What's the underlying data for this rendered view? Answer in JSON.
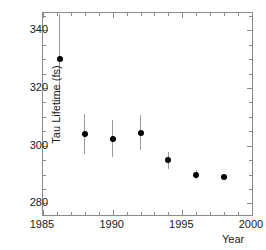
{
  "chart_data": {
    "type": "scatter",
    "title": "",
    "xlabel": "Year",
    "ylabel": "Tau Lifetime (fs)",
    "xlim": [
      1985,
      2000
    ],
    "ylim": [
      276,
      346
    ],
    "grid": false,
    "legend": null,
    "xticks": [
      1985,
      1990,
      1995,
      2000
    ],
    "xtick_labels": [
      "1985",
      "1990",
      "1995",
      "2000"
    ],
    "yticks": [
      280,
      300,
      320,
      340
    ],
    "ytick_labels": [
      "280",
      "300",
      "320",
      "340"
    ],
    "x": [
      1986.2,
      1988.0,
      1990.0,
      1992.0,
      1994.0,
      1996.0,
      1998.0
    ],
    "values": [
      330.0,
      304.0,
      302.5,
      304.5,
      295.0,
      290.0,
      289.0
    ],
    "yerr_low": [
      15.5,
      7.0,
      6.5,
      6.0,
      3.0,
      1.5,
      0.8
    ],
    "yerr_high": [
      15.5,
      7.0,
      6.5,
      6.0,
      3.0,
      1.5,
      0.8
    ],
    "marker": "filled-circle",
    "marker_color": "#000000",
    "errorbar_color": "#9a9a9a",
    "axis_color": "#8a8a8a",
    "points": [
      {
        "label": "1986",
        "year": 1986.2,
        "value": 330.0,
        "err": 15.5
      },
      {
        "label": "1988",
        "year": 1988.0,
        "value": 304.0,
        "err": 7.0
      },
      {
        "label": "1990",
        "year": 1990.0,
        "value": 302.5,
        "err": 6.5
      },
      {
        "label": "1992",
        "year": 1992.0,
        "value": 304.5,
        "err": 6.0
      },
      {
        "label": "1994",
        "year": 1994.0,
        "value": 295.0,
        "err": 3.0
      },
      {
        "label": "1996",
        "year": 1996.0,
        "value": 290.0,
        "err": 1.5
      },
      {
        "label": "1998",
        "year": 1998.0,
        "value": 289.0,
        "err": 0.8
      }
    ]
  }
}
